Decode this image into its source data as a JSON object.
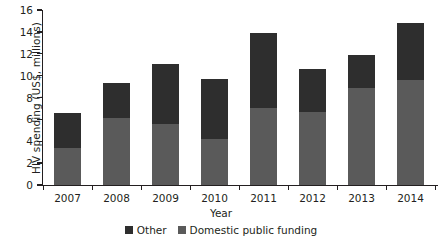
{
  "chart_data": {
    "type": "bar",
    "subtype": "stacked-vertical",
    "title": "",
    "xlabel": "Year",
    "ylabel": "HIV spending (US$, millions)",
    "categories": [
      "2007",
      "2008",
      "2009",
      "2010",
      "2011",
      "2012",
      "2013",
      "2014"
    ],
    "series": [
      {
        "name": "Domestic public funding",
        "color": "#5a5a5a",
        "values": [
          3.4,
          6.1,
          5.6,
          4.2,
          7.0,
          6.7,
          8.9,
          9.6
        ]
      },
      {
        "name": "Other",
        "color": "#2e2e2e",
        "values": [
          3.2,
          3.2,
          5.5,
          5.5,
          6.9,
          3.9,
          3.0,
          5.2
        ]
      }
    ],
    "totals": [
      6.6,
      9.3,
      11.1,
      9.7,
      13.9,
      10.6,
      11.9,
      14.8
    ],
    "ylim": [
      0,
      16
    ],
    "yticks": [
      0,
      2,
      4,
      6,
      8,
      10,
      12,
      14,
      16
    ],
    "ytick_labels": [
      "0",
      "2",
      "4",
      "6",
      "8",
      "10",
      "12",
      "14",
      "16"
    ],
    "grid": false,
    "legend_position": "bottom-center",
    "stack_order_bottom_to_top": [
      "Domestic public funding",
      "Other"
    ]
  },
  "legend": {
    "items": [
      {
        "label": "Other",
        "color": "#2e2e2e"
      },
      {
        "label": "Domestic public funding",
        "color": "#5a5a5a"
      }
    ]
  },
  "axes": {
    "y_title": "HIV spending (US$, millions)",
    "x_title": "Year"
  }
}
